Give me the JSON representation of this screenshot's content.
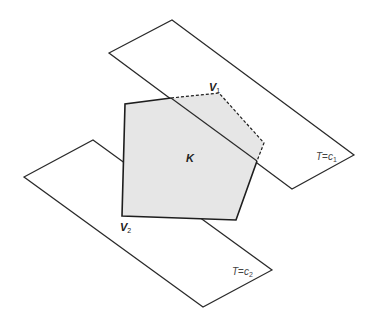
{
  "figure": {
    "polytope_label": "K",
    "vertex_1": {
      "name": "V",
      "sub": "1"
    },
    "vertex_2": {
      "name": "V",
      "sub": "2"
    },
    "plane_upper": {
      "var": "T",
      "eq": "=",
      "const": "c",
      "sub": "1"
    },
    "plane_lower": {
      "var": "T",
      "eq": "=",
      "const": "c",
      "sub": "2"
    },
    "colors": {
      "polytope_fill": "#e6e6e6",
      "stroke": "#1e1e1e",
      "background": "#ffffff"
    }
  }
}
